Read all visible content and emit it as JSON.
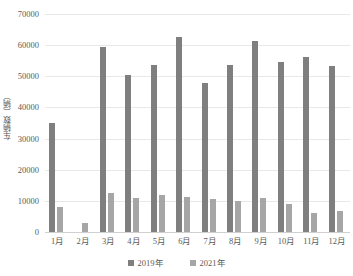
{
  "chart_data": {
    "type": "bar",
    "title": "",
    "xlabel": "",
    "ylabel": "车辆数（辆）",
    "ylim": [
      0,
      70000
    ],
    "ytick_step": 10000,
    "yticks": [
      "70000",
      "60000",
      "50000",
      "40000",
      "30000",
      "20000",
      "10000",
      "0"
    ],
    "grid": true,
    "legend_position": "bottom-center",
    "categories": [
      "1月",
      "2月",
      "3月",
      "4月",
      "5月",
      "6月",
      "7月",
      "8月",
      "9月",
      "10月",
      "11月",
      "12月"
    ],
    "series": [
      {
        "name": "2019年",
        "color": "#7f7f7f",
        "values": [
          35000,
          0,
          59500,
          50500,
          53500,
          62500,
          48000,
          53500,
          61200,
          54700,
          56100,
          53400
        ]
      },
      {
        "name": "2021年",
        "color": "#a6a6a6",
        "values": [
          8000,
          3000,
          12500,
          11000,
          12000,
          11300,
          10500,
          10000,
          10800,
          9000,
          6000,
          6700
        ]
      }
    ]
  },
  "colors": {
    "gridline": "#e8e8e8",
    "axis": "#d0d0d0",
    "text": "#5a5a5a",
    "background": "#ffffff"
  }
}
